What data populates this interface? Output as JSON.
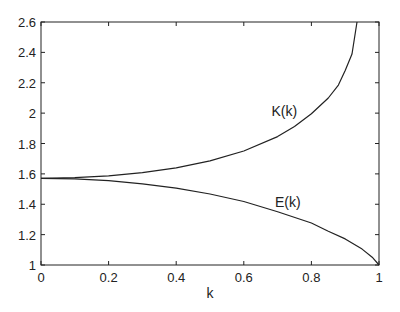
{
  "chart_data": {
    "type": "line",
    "title": "",
    "xlabel": "k",
    "ylabel": "",
    "xlim": [
      0,
      1
    ],
    "ylim": [
      1,
      2.6
    ],
    "grid": false,
    "legend": "none (inline curve labels)",
    "x_ticks": [
      0,
      0.2,
      0.4,
      0.6,
      0.8,
      1
    ],
    "x_tick_labels": [
      "0",
      "0.2",
      "0.4",
      "0.6",
      "0.8",
      "1"
    ],
    "y_ticks": [
      1,
      1.2,
      1.4,
      1.6,
      1.8,
      2,
      2.2,
      2.4,
      2.6
    ],
    "y_tick_labels": [
      "1",
      "1.2",
      "1.4",
      "1.6",
      "1.8",
      "2",
      "2.2",
      "2.4",
      "2.6"
    ],
    "series": [
      {
        "name": "K(k)",
        "label_position": {
          "k": 0.72,
          "value": 1.98
        },
        "x": [
          0,
          0.1,
          0.2,
          0.3,
          0.4,
          0.5,
          0.6,
          0.7,
          0.75,
          0.8,
          0.85,
          0.88,
          0.9,
          0.92,
          0.935
        ],
        "values": [
          1.5708,
          1.5747,
          1.5869,
          1.608,
          1.64,
          1.6858,
          1.7508,
          1.8457,
          1.911,
          1.9953,
          2.0995,
          2.1842,
          2.2805,
          2.389,
          2.6
        ]
      },
      {
        "name": "E(k)",
        "label_position": {
          "k": 0.73,
          "value": 1.38
        },
        "x": [
          0,
          0.1,
          0.2,
          0.3,
          0.4,
          0.5,
          0.6,
          0.7,
          0.8,
          0.85,
          0.9,
          0.95,
          0.98,
          1.0
        ],
        "values": [
          1.5708,
          1.5669,
          1.555,
          1.5348,
          1.5055,
          1.4675,
          1.4181,
          1.3507,
          1.2763,
          1.2225,
          1.1717,
          1.1048,
          1.0514,
          1.0
        ]
      }
    ],
    "colors": {
      "line": "#222222",
      "axes": "#222222",
      "background": "#ffffff"
    }
  }
}
